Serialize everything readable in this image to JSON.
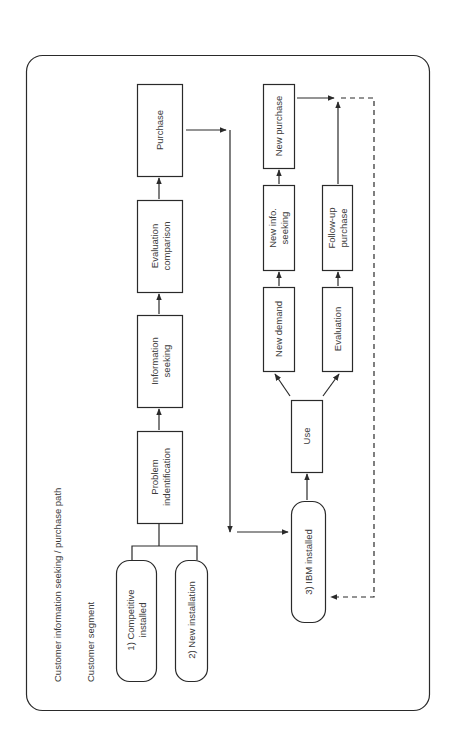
{
  "title": "Customer information seeking / purchase path",
  "segment_label": "Customer segment",
  "segments": [
    {
      "line1": "1) Competitive",
      "line2": "installed"
    },
    {
      "line1": "2) New installation",
      "line2": ""
    },
    {
      "line1": "3) IBM installed",
      "line2": ""
    }
  ],
  "main_path": [
    {
      "line1": "Problem",
      "line2": "indentification"
    },
    {
      "line1": "Information",
      "line2": "seeking"
    },
    {
      "line1": "Evaluation",
      "line2": "comparison"
    },
    {
      "line1": "Purchase",
      "line2": ""
    }
  ],
  "loop": {
    "use": "Use",
    "new_demand": "New demand",
    "new_info": {
      "line1": "New info.",
      "line2": "seeking"
    },
    "new_purchase": "New purchase",
    "evaluation": "Evaluation",
    "follow_up": {
      "line1": "Follow-up",
      "line2": "purchase"
    }
  },
  "colors": {
    "stroke": "#2a2a2a",
    "text": "#3a3a3a"
  }
}
